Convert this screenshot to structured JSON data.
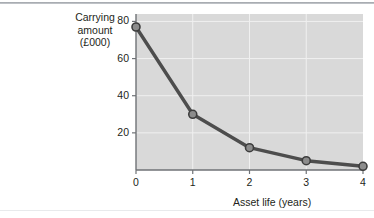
{
  "figure": {
    "background_color": "#ffffff",
    "plot_background_color": "#d9d9d9",
    "gridline_color": "#f0f0f0",
    "axis_color": "#6f7276",
    "series_color": "#4d4d4d",
    "marker_fill_color": "#8c8c8c",
    "marker_edge_color": "#3d3d3d",
    "rule_top_color": "#a0a4a9",
    "rule_bottom_color": "#e8eaec"
  },
  "chart_data": {
    "type": "line",
    "title": "",
    "xlabel": "Asset life (years)",
    "ylabel": "Carrying amount (£000)",
    "ylabel_lines": [
      "Carrying",
      "amount",
      "(£000)"
    ],
    "x": [
      0,
      1,
      2,
      3,
      4
    ],
    "values": [
      77,
      30,
      12,
      5,
      2
    ],
    "series": [
      {
        "name": "Carrying amount",
        "x": [
          0,
          1,
          2,
          3,
          4
        ],
        "values": [
          77,
          30,
          12,
          5,
          2
        ]
      }
    ],
    "xlim": [
      0,
      4
    ],
    "ylim": [
      0,
      84
    ],
    "xticks": [
      0,
      1,
      2,
      3,
      4
    ],
    "xtick_labels": [
      "0",
      "1",
      "2",
      "3",
      "4"
    ],
    "yticks": [
      20,
      40,
      60,
      80
    ],
    "ytick_labels": [
      "20",
      "40",
      "60",
      "80"
    ],
    "grid": true,
    "legend": false,
    "marker": "circle"
  }
}
